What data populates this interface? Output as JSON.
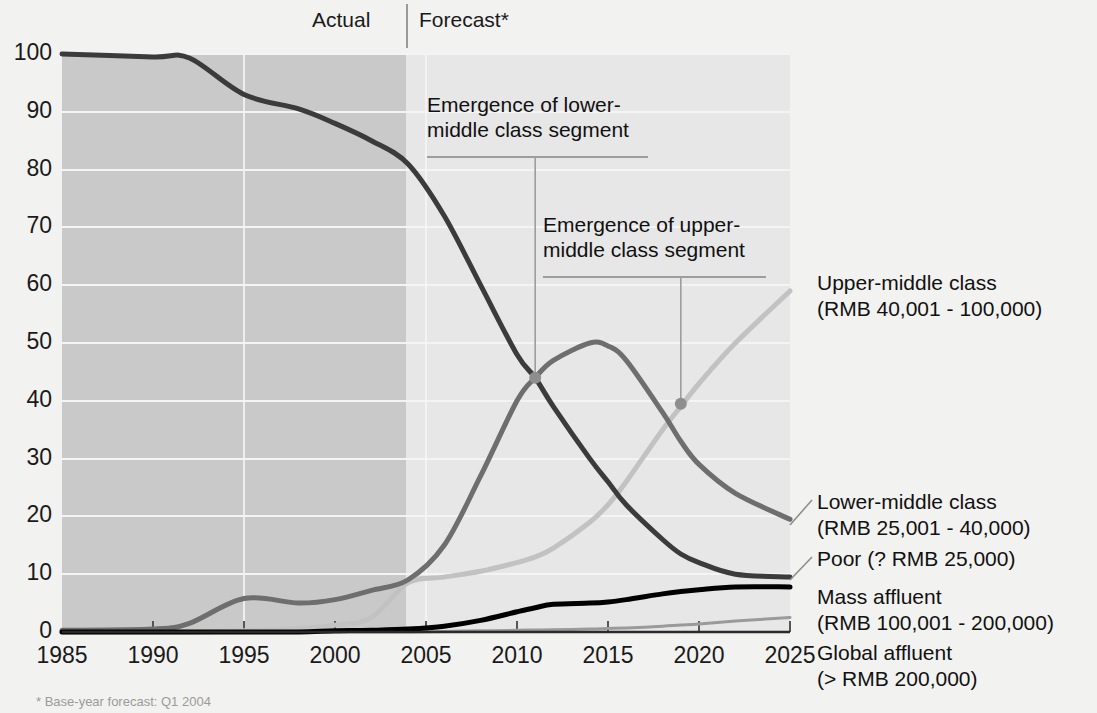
{
  "periods": {
    "actual_label": "Actual",
    "forecast_label": "Forecast*"
  },
  "annotations": {
    "lower_line1": "Emergence of lower-",
    "lower_line2": "middle class segment",
    "upper_line1": "Emergence of upper-",
    "upper_line2": "middle class segment"
  },
  "series_labels": {
    "upper_middle_l1": "Upper-middle class",
    "upper_middle_l2": "(RMB 40,001 - 100,000)",
    "lower_middle_l1": "Lower-middle class",
    "lower_middle_l2": "(RMB 25,001 - 40,000)",
    "poor_l1": "Poor (? RMB 25,000)",
    "mass_l1": "Mass affluent",
    "mass_l2": "(RMB 100,001 - 200,000)",
    "global_l1": "Global affluent",
    "global_l2": "(> RMB 200,000)"
  },
  "footnote": "* Base-year forecast: Q1 2004",
  "colors": {
    "poor": "#3b3b3b",
    "lower_middle": "#6e6e6e",
    "upper_middle": "#c2c2c2",
    "mass_affluent": "#000000",
    "global_affluent": "#9a9a9a",
    "band_actual": "#c9c9c9",
    "band_forecast": "#e7e7e7",
    "grid": "#f4f4f4",
    "leader": "#9d9d9d"
  },
  "chart_data": {
    "type": "line",
    "title": "",
    "xlabel": "",
    "ylabel": "",
    "xlim": [
      1985,
      2025
    ],
    "ylim": [
      0,
      100
    ],
    "grid": true,
    "legend_position": "right-inline",
    "forecast_start": 2004,
    "xticks": [
      1985,
      1990,
      1995,
      2000,
      2005,
      2010,
      2015,
      2020,
      2025
    ],
    "yticks": [
      0,
      10,
      20,
      30,
      40,
      50,
      60,
      70,
      80,
      90,
      100
    ],
    "x": [
      1985,
      1990,
      1992,
      1995,
      1998,
      2000,
      2002,
      2004,
      2006,
      2008,
      2010,
      2011,
      2012,
      2014,
      2015,
      2016,
      2018,
      2019,
      2020,
      2022,
      2025
    ],
    "series": [
      {
        "name": "Poor (? RMB 25,000)",
        "color": "#3b3b3b",
        "values": [
          100,
          99.5,
          99.3,
          93,
          90.5,
          88,
          85,
          81,
          72,
          60,
          48,
          44,
          39,
          30,
          26,
          22,
          16,
          13.5,
          12,
          10,
          9.5
        ]
      },
      {
        "name": "Lower-middle class (RMB 25,001 - 40,000)",
        "color": "#6e6e6e",
        "values": [
          0.3,
          0.5,
          1.5,
          5.8,
          5.0,
          5.6,
          7.2,
          9.0,
          15,
          27,
          40,
          44,
          47,
          50,
          49.5,
          47,
          38,
          33,
          29,
          24,
          19.5
        ]
      },
      {
        "name": "Upper-middle class (RMB 40,001 - 100,000)",
        "color": "#c2c2c2",
        "values": [
          0,
          0,
          0,
          0.2,
          0.6,
          1.2,
          2.5,
          8.5,
          9.5,
          10.5,
          12,
          13,
          14.5,
          19,
          22,
          26,
          35,
          39,
          43,
          50,
          59
        ]
      },
      {
        "name": "Mass affluent (RMB 100,001 - 200,000)",
        "color": "#000000",
        "values": [
          0,
          0,
          0,
          0,
          0,
          0.2,
          0.3,
          0.5,
          1.0,
          2.0,
          3.5,
          4.2,
          4.8,
          5.0,
          5.2,
          5.6,
          6.6,
          7.0,
          7.3,
          7.8,
          7.8
        ]
      },
      {
        "name": "Global affluent (> RMB 200,000)",
        "color": "#9a9a9a",
        "values": [
          0,
          0,
          0,
          0,
          0,
          0,
          0,
          0,
          0.1,
          0.2,
          0.3,
          0.35,
          0.4,
          0.5,
          0.6,
          0.7,
          1.0,
          1.2,
          1.4,
          1.9,
          2.5
        ]
      }
    ],
    "annotation_points": [
      {
        "label": "Emergence of lower-middle class segment",
        "x": 2011,
        "y": 44
      },
      {
        "label": "Emergence of upper-middle class segment",
        "x": 2019,
        "y": 39.5
      }
    ]
  }
}
